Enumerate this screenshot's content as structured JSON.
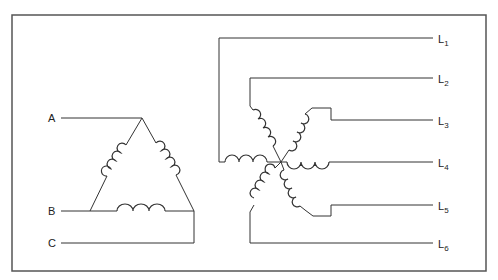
{
  "diagram": {
    "type": "electrical-schematic",
    "delta": {
      "terminals": [
        {
          "id": "A",
          "label": "A"
        },
        {
          "id": "B",
          "label": "B"
        },
        {
          "id": "C",
          "label": "C"
        }
      ],
      "coils": 3
    },
    "star": {
      "leads": [
        {
          "id": "L1",
          "base": "L",
          "sub": "1"
        },
        {
          "id": "L2",
          "base": "L",
          "sub": "2"
        },
        {
          "id": "L3",
          "base": "L",
          "sub": "3"
        },
        {
          "id": "L4",
          "base": "L",
          "sub": "4"
        },
        {
          "id": "L5",
          "base": "L",
          "sub": "5"
        },
        {
          "id": "L6",
          "base": "L",
          "sub": "6"
        }
      ],
      "coils": 6
    },
    "colors": {
      "line": "#333333",
      "border": "#555555",
      "background": "#ffffff"
    }
  }
}
